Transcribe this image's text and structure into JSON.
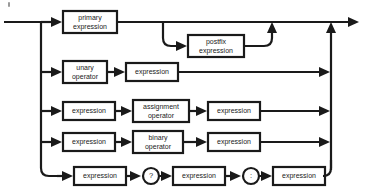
{
  "diagram": {
    "title": "expression",
    "type": "railroad-syntax-diagram",
    "colors": {
      "ink": "#1a1a1a",
      "paper": "#ffffff"
    },
    "nodes": {
      "primary_expression": "primary\nexpression",
      "primary_expression_l1": "primary",
      "primary_expression_l2": "expression",
      "postfix_expression_l1": "postfix",
      "postfix_expression_l2": "expression",
      "unary_operator_l1": "unary",
      "unary_operator_l2": "operator",
      "assignment_operator_l1": "assignment",
      "assignment_operator_l2": "operator",
      "binary_operator_l1": "binary",
      "binary_operator_l2": "operator",
      "expression": "expression",
      "question_mark": "?",
      "colon": ":"
    },
    "rows": [
      {
        "id": "row-primary",
        "label": "primary expression with optional postfix",
        "boxes": [
          "primary expression",
          "postfix expression"
        ]
      },
      {
        "id": "row-unary",
        "label": "unary operator expression",
        "boxes": [
          "unary operator",
          "expression"
        ]
      },
      {
        "id": "row-assignment",
        "label": "assignment expression",
        "boxes": [
          "expression",
          "assignment operator",
          "expression"
        ]
      },
      {
        "id": "row-binary",
        "label": "binary expression",
        "boxes": [
          "expression",
          "binary operator",
          "expression"
        ]
      },
      {
        "id": "row-conditional",
        "label": "conditional expression",
        "boxes": [
          "expression",
          "?",
          "expression",
          ":",
          "expression"
        ]
      }
    ]
  }
}
